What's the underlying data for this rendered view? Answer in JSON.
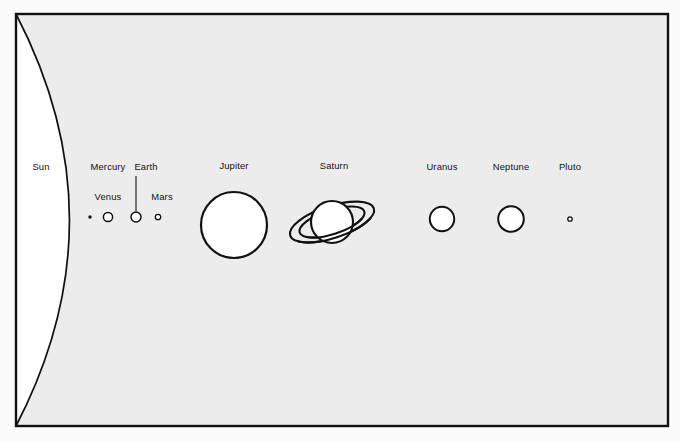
{
  "figure": {
    "kind": "solar-system-scale-diagram",
    "background_color": "#ececec",
    "outer_color": "#fbfbfb",
    "stroke_color": "#111111",
    "body_fill": "#ffffff",
    "frame": {
      "x": 16,
      "y": 14,
      "width": 652,
      "height": 412
    },
    "sun": {
      "label": "Sun",
      "label_x": 41,
      "label_y": 170,
      "arc_apex_x": 82,
      "description": "giant arc from top-left corner to bottom-left corner"
    },
    "planets": [
      {
        "label": "Mercury",
        "label_x": 108,
        "label_y": 170,
        "cx": 90,
        "cy": 217,
        "r": 1.7,
        "shape": "dot",
        "leader": false
      },
      {
        "label": "Venus",
        "label_x": 108,
        "label_y": 200,
        "cx": 108,
        "cy": 217,
        "r": 4.6,
        "shape": "circle",
        "leader": false
      },
      {
        "label": "Earth",
        "label_x": 146,
        "label_y": 170,
        "cx": 136,
        "cy": 217,
        "r": 5.0,
        "shape": "circle",
        "leader": true,
        "leader_x": 136,
        "leader_y1": 176,
        "leader_y2": 211
      },
      {
        "label": "Mars",
        "label_x": 162,
        "label_y": 200,
        "cx": 158,
        "cy": 217,
        "r": 2.7,
        "shape": "circle",
        "leader": false
      },
      {
        "label": "Jupiter",
        "label_x": 234,
        "label_y": 169,
        "cx": 234,
        "cy": 225,
        "r": 33.0,
        "shape": "circle",
        "leader": false
      },
      {
        "label": "Saturn",
        "label_x": 334,
        "label_y": 169,
        "cx": 332,
        "cy": 222,
        "r": 21.0,
        "shape": "ringed",
        "leader": false,
        "ring_outer_rx": 44,
        "ring_outer_ry": 16,
        "ring_inner_rx": 34,
        "ring_inner_ry": 12,
        "ring_tilt": -18
      },
      {
        "label": "Uranus",
        "label_x": 442,
        "label_y": 170,
        "cx": 442,
        "cy": 219,
        "r": 12.2,
        "shape": "circle",
        "leader": false
      },
      {
        "label": "Neptune",
        "label_x": 511,
        "label_y": 170,
        "cx": 511,
        "cy": 219,
        "r": 12.8,
        "shape": "circle",
        "leader": false
      },
      {
        "label": "Pluto",
        "label_x": 570,
        "label_y": 170,
        "cx": 570,
        "cy": 219,
        "r": 2.2,
        "shape": "circle",
        "leader": false
      }
    ]
  }
}
